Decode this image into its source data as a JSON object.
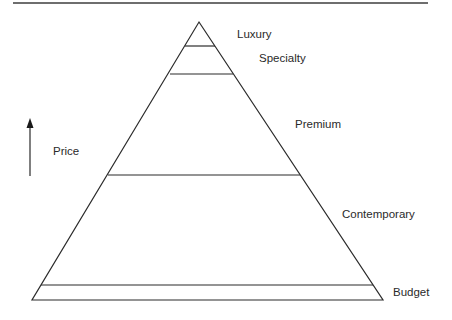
{
  "diagram": {
    "type": "pyramid",
    "axis": {
      "label": "Price",
      "direction": "up"
    },
    "levels": [
      {
        "name": "Luxury"
      },
      {
        "name": "Specialty"
      },
      {
        "name": "Premium"
      },
      {
        "name": "Contemporary"
      },
      {
        "name": "Budget"
      }
    ]
  }
}
